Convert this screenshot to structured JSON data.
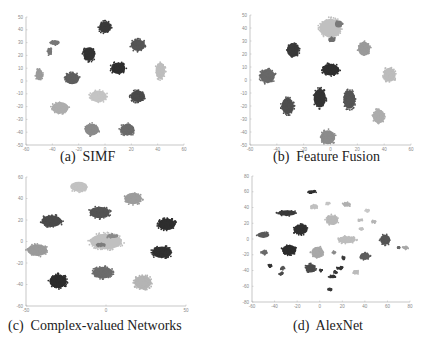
{
  "chart_data": [
    {
      "type": "scatter",
      "id": "a",
      "caption": "(a)  SIMF",
      "title": "SIMF",
      "xlabel": "",
      "ylabel": "",
      "xlim": [
        -60,
        60
      ],
      "ylim": [
        -50,
        50
      ],
      "xticks": [
        -60,
        -40,
        -20,
        0,
        20,
        40,
        60
      ],
      "yticks": [
        -50,
        -40,
        -30,
        -20,
        -10,
        0,
        10,
        20,
        30,
        40,
        50
      ],
      "grid": false,
      "clusters": [
        {
          "x": 0,
          "y": 42,
          "rx": 5,
          "ry": 5,
          "color": "#3a3a3a"
        },
        {
          "x": -12,
          "y": 21,
          "rx": 5,
          "ry": 6,
          "color": "#333333"
        },
        {
          "x": 25,
          "y": 28,
          "rx": 6,
          "ry": 5,
          "color": "#555555"
        },
        {
          "x": 10,
          "y": 10,
          "rx": 6,
          "ry": 5,
          "color": "#2e2e2e"
        },
        {
          "x": 42,
          "y": 8,
          "rx": 4,
          "ry": 7,
          "color": "#bdbdbd"
        },
        {
          "x": -25,
          "y": 2,
          "rx": 6,
          "ry": 5,
          "color": "#5e5e5e"
        },
        {
          "x": -50,
          "y": 5,
          "rx": 3,
          "ry": 5,
          "color": "#9a9a9a"
        },
        {
          "x": -38,
          "y": 30,
          "rx": 4,
          "ry": 2,
          "color": "#777777"
        },
        {
          "x": -42,
          "y": 23,
          "rx": 2,
          "ry": 3,
          "color": "#777777"
        },
        {
          "x": -5,
          "y": -12,
          "rx": 7,
          "ry": 5,
          "color": "#c4c4c4"
        },
        {
          "x": 25,
          "y": -12,
          "rx": 6,
          "ry": 5,
          "color": "#4a4a4a"
        },
        {
          "x": -34,
          "y": -21,
          "rx": 7,
          "ry": 5,
          "color": "#adadad"
        },
        {
          "x": -10,
          "y": -38,
          "rx": 6,
          "ry": 5,
          "color": "#8a8a8a"
        },
        {
          "x": 17,
          "y": -38,
          "rx": 6,
          "ry": 5,
          "color": "#6a6a6a"
        }
      ]
    },
    {
      "type": "scatter",
      "id": "b",
      "caption": "(b)  Feature Fusion",
      "title": "Feature Fusion",
      "xlabel": "",
      "ylabel": "",
      "xlim": [
        -60,
        60
      ],
      "ylim": [
        -50,
        50
      ],
      "xticks": [
        -60,
        -40,
        -20,
        0,
        20,
        40,
        60
      ],
      "yticks": [
        -50,
        -40,
        -30,
        -20,
        -10,
        0,
        10,
        20,
        30,
        40,
        50
      ],
      "grid": false,
      "clusters": [
        {
          "x": 0,
          "y": 40,
          "rx": 9,
          "ry": 8,
          "color": "#c0c0c0"
        },
        {
          "x": 6,
          "y": 43,
          "rx": 3,
          "ry": 3,
          "color": "#7a7a7a"
        },
        {
          "x": 1,
          "y": 31,
          "rx": 3,
          "ry": 2,
          "color": "#6f6f6f"
        },
        {
          "x": -28,
          "y": 23,
          "rx": 5,
          "ry": 6,
          "color": "#3a3a3a"
        },
        {
          "x": 25,
          "y": 24,
          "rx": 5,
          "ry": 6,
          "color": "#9a9a9a"
        },
        {
          "x": 0,
          "y": 8,
          "rx": 7,
          "ry": 5,
          "color": "#2f2f2f"
        },
        {
          "x": 44,
          "y": 4,
          "rx": 5,
          "ry": 6,
          "color": "#bcbcbc"
        },
        {
          "x": -47,
          "y": 3,
          "rx": 6,
          "ry": 6,
          "color": "#686868"
        },
        {
          "x": -8,
          "y": -14,
          "rx": 5,
          "ry": 8,
          "color": "#343434"
        },
        {
          "x": 14,
          "y": -15,
          "rx": 5,
          "ry": 8,
          "color": "#555555"
        },
        {
          "x": -32,
          "y": -20,
          "rx": 5,
          "ry": 7,
          "color": "#4e4e4e"
        },
        {
          "x": 36,
          "y": -28,
          "rx": 5,
          "ry": 6,
          "color": "#adadad"
        },
        {
          "x": -2,
          "y": -44,
          "rx": 6,
          "ry": 6,
          "color": "#8c8c8c"
        }
      ]
    },
    {
      "type": "scatter",
      "id": "c",
      "caption": "(c)  Complex-valued Networks",
      "title": "Complex-valued Networks",
      "xlabel": "",
      "ylabel": "",
      "xlim": [
        -50,
        50
      ],
      "ylim": [
        -60,
        60
      ],
      "xticks": [
        -50,
        0,
        50
      ],
      "yticks": [
        -60,
        -40,
        -20,
        0,
        20,
        40,
        60
      ],
      "grid": false,
      "clusters": [
        {
          "x": -17,
          "y": 51,
          "rx": 6,
          "ry": 5,
          "color": "#c2c2c2"
        },
        {
          "x": 17,
          "y": 40,
          "rx": 6,
          "ry": 6,
          "color": "#9c9c9c"
        },
        {
          "x": -4,
          "y": 27,
          "rx": 7,
          "ry": 6,
          "color": "#555555"
        },
        {
          "x": -34,
          "y": 19,
          "rx": 7,
          "ry": 6,
          "color": "#4a4a4a"
        },
        {
          "x": 38,
          "y": 16,
          "rx": 6,
          "ry": 6,
          "color": "#2e2e2e"
        },
        {
          "x": 0,
          "y": 0,
          "rx": 11,
          "ry": 8,
          "color": "#c0c0c0"
        },
        {
          "x": 4,
          "y": 5,
          "rx": 4,
          "ry": 2,
          "color": "#8a8a8a"
        },
        {
          "x": -3,
          "y": -3,
          "rx": 3,
          "ry": 2,
          "color": "#7d7d7d"
        },
        {
          "x": -43,
          "y": -8,
          "rx": 7,
          "ry": 6,
          "color": "#9a9a9a"
        },
        {
          "x": 35,
          "y": -10,
          "rx": 7,
          "ry": 6,
          "color": "#303030"
        },
        {
          "x": -30,
          "y": -37,
          "rx": 6,
          "ry": 7,
          "color": "#2c2c2c"
        },
        {
          "x": -2,
          "y": -29,
          "rx": 7,
          "ry": 6,
          "color": "#6c6c6c"
        },
        {
          "x": 23,
          "y": -38,
          "rx": 6,
          "ry": 7,
          "color": "#b4b4b4"
        }
      ]
    },
    {
      "type": "scatter",
      "id": "d",
      "caption": "(d)  AlexNet",
      "title": "AlexNet",
      "xlabel": "",
      "ylabel": "",
      "xlim": [
        -60,
        80
      ],
      "ylim": [
        -80,
        80
      ],
      "xticks": [
        -60,
        -40,
        -20,
        0,
        20,
        40,
        60,
        80
      ],
      "yticks": [
        -80,
        -60,
        -40,
        -20,
        0,
        20,
        40,
        60,
        80
      ],
      "grid": false,
      "clusters": [
        {
          "x": -7,
          "y": 60,
          "rx": 4,
          "ry": 2,
          "color": "#2e2e2e"
        },
        {
          "x": -5,
          "y": 41,
          "rx": 4,
          "ry": 3,
          "color": "#c0c0c0"
        },
        {
          "x": 7,
          "y": 45,
          "rx": 2,
          "ry": 1.5,
          "color": "#c4c4c4"
        },
        {
          "x": 24,
          "y": 44,
          "rx": 4,
          "ry": 3,
          "color": "#b0b0b0"
        },
        {
          "x": -29,
          "y": 33,
          "rx": 9,
          "ry": 4,
          "color": "#3a3a3a"
        },
        {
          "x": 11,
          "y": 24,
          "rx": 6,
          "ry": 7,
          "color": "#b8b8b8"
        },
        {
          "x": 42,
          "y": 36,
          "rx": 2,
          "ry": 2,
          "color": "#c8c8c8"
        },
        {
          "x": 36,
          "y": 24,
          "rx": 2,
          "ry": 2,
          "color": "#bdbdbd"
        },
        {
          "x": 48,
          "y": 22,
          "rx": 2,
          "ry": 2,
          "color": "#b5b5b5"
        },
        {
          "x": -17,
          "y": 12,
          "rx": 7,
          "ry": 7,
          "color": "#303030"
        },
        {
          "x": 37,
          "y": 13,
          "rx": 2,
          "ry": 2,
          "color": "#c2c2c2"
        },
        {
          "x": -50,
          "y": 5,
          "rx": 6,
          "ry": 4,
          "color": "#5a5a5a"
        },
        {
          "x": 24,
          "y": -1,
          "rx": 9,
          "ry": 5,
          "color": "#bdbdbd"
        },
        {
          "x": 58,
          "y": -1,
          "rx": 5,
          "ry": 7,
          "color": "#555555"
        },
        {
          "x": 76,
          "y": -11,
          "rx": 3,
          "ry": 2,
          "color": "#a8a8a8"
        },
        {
          "x": 70,
          "y": -11,
          "rx": 1,
          "ry": 1,
          "color": "#666666"
        },
        {
          "x": -27,
          "y": -14,
          "rx": 7,
          "ry": 7,
          "color": "#2c2c2c"
        },
        {
          "x": -49,
          "y": -17,
          "rx": 3,
          "ry": 3,
          "color": "#6a6a6a"
        },
        {
          "x": -2,
          "y": -17,
          "rx": 6,
          "ry": 8,
          "color": "#a8a8a8"
        },
        {
          "x": 13,
          "y": -17,
          "rx": 2,
          "ry": 1.5,
          "color": "#8a8a8a"
        },
        {
          "x": 40,
          "y": -22,
          "rx": 5,
          "ry": 5,
          "color": "#5e5e5e"
        },
        {
          "x": 21,
          "y": -24,
          "rx": 2,
          "ry": 2,
          "color": "#3a3a3a"
        },
        {
          "x": -8,
          "y": -37,
          "rx": 5,
          "ry": 6,
          "color": "#4a4a4a"
        },
        {
          "x": -44,
          "y": -34,
          "rx": 2,
          "ry": 2,
          "color": "#333333"
        },
        {
          "x": -33,
          "y": -37,
          "rx": 2,
          "ry": 2,
          "color": "#555555"
        },
        {
          "x": -34,
          "y": -44,
          "rx": 2,
          "ry": 2,
          "color": "#4a4a4a"
        },
        {
          "x": 1,
          "y": -40,
          "rx": 1.5,
          "ry": 1.5,
          "color": "#3a3a3a"
        },
        {
          "x": 18,
          "y": -37,
          "rx": 3,
          "ry": 2,
          "color": "#333333"
        },
        {
          "x": 14,
          "y": -42,
          "rx": 2,
          "ry": 1.5,
          "color": "#3a3a3a"
        },
        {
          "x": 32,
          "y": -42,
          "rx": 3,
          "ry": 3,
          "color": "#bbbbbb"
        },
        {
          "x": 11,
          "y": -48,
          "rx": 3,
          "ry": 2,
          "color": "#333333"
        },
        {
          "x": 9,
          "y": -64,
          "rx": 2,
          "ry": 2,
          "color": "#3a3a3a"
        }
      ]
    }
  ],
  "panels": {
    "a": {
      "caption": "(a)  SIMF"
    },
    "b": {
      "caption": "(b)  Feature Fusion"
    },
    "c": {
      "caption": "(c)  Complex-valued Networks"
    },
    "d": {
      "caption": "(d)  AlexNet"
    }
  },
  "style": {
    "axis_color": "#b0b0b0",
    "tick_label_color": "#8a8a8a"
  }
}
